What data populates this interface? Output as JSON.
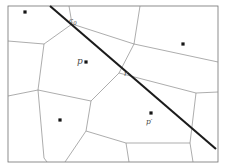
{
  "figure": {
    "background_color": "#ffffff",
    "frame_color": "#707070",
    "edge_color": "#8a8a8a",
    "site_color": "#151515",
    "query_line_color": "#1b1b1b",
    "width": 226,
    "height": 168
  },
  "labels": {
    "c0": {
      "base": "c",
      "subscript": "0",
      "x": 69,
      "y": 23
    },
    "p": {
      "text": "p",
      "x": 77,
      "y": 64
    },
    "r": {
      "text": "r",
      "x": 124,
      "y": 76
    },
    "p_prime": {
      "base": "p",
      "prime": "′",
      "x": 146,
      "y": 124
    }
  },
  "sites": [
    {
      "name": "site-top-left",
      "x": 25,
      "y": 12
    },
    {
      "name": "site-p",
      "x": 86,
      "y": 62
    },
    {
      "name": "site-top-right",
      "x": 183,
      "y": 44
    },
    {
      "name": "site-bottom-left",
      "x": 60,
      "y": 120
    },
    {
      "name": "site-p-prime",
      "x": 151,
      "y": 113
    }
  ],
  "query_line": {
    "name": "query-segment",
    "x1": 50,
    "y1": 6,
    "x2": 216,
    "y2": 149,
    "intersections": [
      {
        "label": "c0",
        "x": 75,
        "y": 27
      },
      {
        "label": "r",
        "x": 119,
        "y": 73
      }
    ]
  },
  "frame": {
    "x": 8,
    "y": 6,
    "width": 210,
    "height": 156
  },
  "edges": [
    {
      "name": "edge-top-left-vert",
      "points": "69,6 72,24"
    },
    {
      "name": "edge-c0-to-right",
      "points": "72,24 134,44"
    },
    {
      "name": "edge-c0-down-left",
      "points": "72,24 44,44"
    },
    {
      "name": "edge-left-upper",
      "points": "44,44 8,41"
    },
    {
      "name": "edge-left-mid-down",
      "points": "44,44 38,90"
    },
    {
      "name": "edge-left-lower-out",
      "points": "38,90 8,96"
    },
    {
      "name": "edge-left-bottom-down",
      "points": "38,90 44,158"
    },
    {
      "name": "edge-bottom-left-diag",
      "points": "44,158 47,162"
    },
    {
      "name": "edge-mid-left-down",
      "points": "38,90 91,101"
    },
    {
      "name": "edge-mid-vert-1",
      "points": "91,101 86,131"
    },
    {
      "name": "edge-mid-bottom-left",
      "points": "86,131 65,162"
    },
    {
      "name": "edge-mid-bottom-right",
      "points": "86,131 126,143"
    },
    {
      "name": "edge-mid-bottom-down",
      "points": "126,143 129,162"
    },
    {
      "name": "edge-center-up",
      "points": "91,101 119,73"
    },
    {
      "name": "edge-center-r-up",
      "points": "119,73 134,44"
    },
    {
      "name": "edge-r-right",
      "points": "119,73 196,93"
    },
    {
      "name": "edge-right-t-up",
      "points": "196,93 218,92"
    },
    {
      "name": "edge-right-t-down",
      "points": "196,93 190,143"
    },
    {
      "name": "edge-right-bottom",
      "points": "190,143 193,162"
    },
    {
      "name": "edge-bottom-mid-right",
      "points": "126,143 190,143"
    },
    {
      "name": "edge-top-mid-up",
      "points": "134,44 140,6"
    },
    {
      "name": "edge-top-right-diag",
      "points": "134,44 218,62"
    }
  ]
}
